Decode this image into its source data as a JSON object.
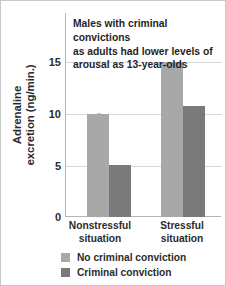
{
  "chart_data": {
    "type": "bar",
    "title": "Males with criminal convictions as adults had lower levels of arousal as 13-year-olds",
    "title_lines": [
      "Males with criminal convictions",
      "as adults had lower levels of",
      "arousal as 13-year-olds"
    ],
    "xlabel": "",
    "ylabel": "Adrenaline excretion (ng/min.)",
    "ylabel_lines": [
      "Adrenaline",
      "excretion (ng/min.)"
    ],
    "categories": [
      "Nonstressful situation",
      "Stressful situation"
    ],
    "category_lines": [
      [
        "Nonstressful",
        "situation"
      ],
      [
        "Stressful",
        "situation"
      ]
    ],
    "series": [
      {
        "name": "No criminal conviction",
        "values": [
          10.0,
          15.0
        ],
        "color": "#a8a8a8"
      },
      {
        "name": "Criminal conviction",
        "values": [
          5.0,
          10.7
        ],
        "color": "#7a7a7a"
      }
    ],
    "ylim": [
      0,
      16.7
    ],
    "yticks": [
      0,
      5,
      10,
      15
    ],
    "ytick_labels": [
      "0",
      "5",
      "10",
      "15"
    ],
    "grid": true,
    "legend_position": "bottom-left"
  },
  "legend": {
    "items": [
      {
        "label": "No criminal conviction",
        "color": "#a8a8a8"
      },
      {
        "label": "Criminal conviction",
        "color": "#7a7a7a"
      }
    ]
  },
  "colors": {
    "grid": "#d7d7d7",
    "axis": "#b4b4b4",
    "text": "#2b2b2b",
    "frame": "#c9c9c9",
    "background": "#ffffff"
  }
}
